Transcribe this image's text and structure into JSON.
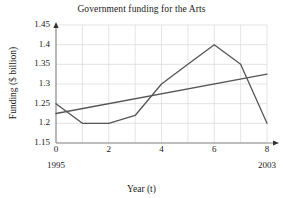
{
  "chart_data": {
    "type": "line",
    "title": "Government funding for the Arts",
    "xlabel": "Year (t)",
    "ylabel": "Funding ($ billion)",
    "xlim": [
      0,
      8
    ],
    "ylim": [
      1.15,
      1.45
    ],
    "xticks": [
      "0",
      "2",
      "4",
      "6",
      "8"
    ],
    "xtick_values": [
      0,
      2,
      4,
      6,
      8
    ],
    "yticks": [
      "1.15",
      "1.2",
      "1.25",
      "1.3",
      "1.35",
      "1.4",
      "1.45"
    ],
    "ytick_values": [
      1.15,
      1.2,
      1.25,
      1.3,
      1.35,
      1.4,
      1.45
    ],
    "grid": true,
    "legend": "none",
    "annotations": [
      {
        "text": "1995",
        "x": 0
      },
      {
        "text": "2003",
        "x": 8
      }
    ],
    "series": [
      {
        "name": "Funding",
        "x": [
          0,
          1,
          2,
          3,
          4,
          5,
          6,
          7,
          8
        ],
        "values": [
          1.25,
          1.2,
          1.2,
          1.22,
          1.3,
          1.35,
          1.4,
          1.35,
          1.2
        ],
        "color": "#555555"
      },
      {
        "name": "Trend line",
        "x": [
          0,
          8
        ],
        "values": [
          1.225,
          1.325
        ],
        "color": "#555555"
      }
    ]
  },
  "axis": {
    "grid_color": "#d8d8d8",
    "axis_color": "#888888"
  }
}
